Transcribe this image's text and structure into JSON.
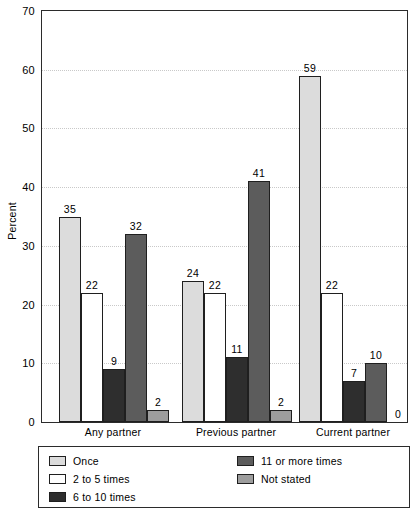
{
  "chart_data": {
    "type": "bar",
    "title": "",
    "xlabel": "",
    "ylabel": "Percent",
    "ylim": [
      0,
      70
    ],
    "yticks": [
      0,
      10,
      20,
      30,
      40,
      50,
      60,
      70
    ],
    "grid": "horizontal-dotted",
    "legend_position": "bottom",
    "categories": [
      "Any partner",
      "Previous partner",
      "Current partner"
    ],
    "series": [
      {
        "name": "Once",
        "color": "#dcdcdc",
        "values": [
          35,
          24,
          59
        ]
      },
      {
        "name": "2 to 5 times",
        "color": "#ffffff",
        "values": [
          22,
          22,
          22
        ]
      },
      {
        "name": "6 to 10 times",
        "color": "#2e2e2e",
        "values": [
          9,
          11,
          7
        ]
      },
      {
        "name": "11 or more times",
        "color": "#5c5c5c",
        "values": [
          32,
          41,
          10
        ]
      },
      {
        "name": "Not stated",
        "color": "#9d9d9d",
        "values": [
          2,
          2,
          0
        ]
      }
    ]
  },
  "axis": {
    "y_title": "Percent",
    "y_tick_labels": [
      "0",
      "10",
      "20",
      "30",
      "40",
      "50",
      "60",
      "70"
    ],
    "x_tick_labels": [
      "Any partner",
      "Previous partner",
      "Current partner"
    ]
  },
  "legend": {
    "left_column": [
      {
        "label": "Once",
        "color": "#dcdcdc"
      },
      {
        "label": "2 to 5 times",
        "color": "#ffffff"
      },
      {
        "label": "6 to 10 times",
        "color": "#2e2e2e"
      }
    ],
    "right_column": [
      {
        "label": "11 or more times",
        "color": "#5c5c5c"
      },
      {
        "label": "Not stated",
        "color": "#9d9d9d"
      }
    ]
  },
  "bar_labels": {
    "group_0": [
      "35",
      "22",
      "9",
      "32",
      "2"
    ],
    "group_1": [
      "24",
      "22",
      "11",
      "41",
      "2"
    ],
    "group_2": [
      "59",
      "22",
      "7",
      "10",
      "0"
    ]
  }
}
